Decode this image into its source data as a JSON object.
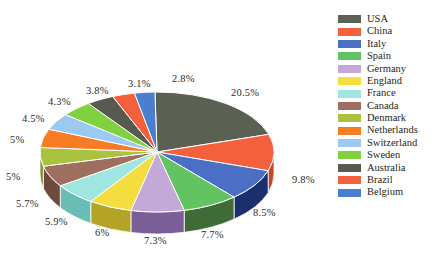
{
  "background": "#ffffff",
  "text_color": "#2b2b2b",
  "legend": {
    "items": [
      {
        "label": "USA",
        "color": "#5b6152",
        "side": "#434839"
      },
      {
        "label": "China",
        "color": "#f4603c",
        "side": "#c94526"
      },
      {
        "label": "Italy",
        "color": "#4a6fc4",
        "side": "#1b2f6e"
      },
      {
        "label": "Spain",
        "color": "#62c362",
        "side": "#3f6b36"
      },
      {
        "label": "Germany",
        "color": "#c3a8d8",
        "side": "#7b5e97"
      },
      {
        "label": "England",
        "color": "#f3dd3f",
        "side": "#b3a327"
      },
      {
        "label": "France",
        "color": "#9fe5e0",
        "side": "#69bdb5"
      },
      {
        "label": "Canada",
        "color": "#9e6f5e",
        "side": "#6d4a3c"
      },
      {
        "label": "Denmark",
        "color": "#a9c23f",
        "side": "#7b8f2c"
      },
      {
        "label": "Netherlands",
        "color": "#f87c24",
        "side": "#c85b12"
      },
      {
        "label": "Switzerland",
        "color": "#9cc9ef",
        "side": "#6fa4d2"
      },
      {
        "label": "Sweden",
        "color": "#7fd13f",
        "side": "#5aa02b"
      },
      {
        "label": "Australia",
        "color": "#58594f",
        "side": "#3d3e36"
      },
      {
        "label": "Brazil",
        "color": "#f4603c",
        "side": "#c94526"
      },
      {
        "label": "Belgium",
        "color": "#4a7fd0",
        "side": "#2a538f"
      }
    ]
  },
  "chart_data": {
    "type": "pie",
    "title": "",
    "legend_position": "right",
    "three_d": true,
    "labels": [
      "USA",
      "China",
      "Italy",
      "Spain",
      "Germany",
      "England",
      "France",
      "Canada",
      "Denmark",
      "Netherlands",
      "Switzerland",
      "Sweden",
      "Australia",
      "Brazil",
      "Belgium"
    ],
    "values": [
      20.5,
      9.8,
      8.5,
      7.7,
      7.3,
      6,
      5.9,
      5.7,
      5,
      5,
      4.5,
      4.3,
      3.8,
      3.1,
      2.8
    ],
    "value_labels": [
      "20.5%",
      "9.8%",
      "8.5%",
      "7.7%",
      "7.3%",
      "6%",
      "5.9%",
      "5.7%",
      "5%",
      "5%",
      "4.5%",
      "4.3%",
      "3.8%",
      "3.1%",
      "2.8%"
    ],
    "unit": "%",
    "colors": [
      "#5b6152",
      "#f4603c",
      "#4a6fc4",
      "#62c362",
      "#c3a8d8",
      "#f3dd3f",
      "#9fe5e0",
      "#9e6f5e",
      "#a9c23f",
      "#f87c24",
      "#9cc9ef",
      "#7fd13f",
      "#58594f",
      "#f4603c",
      "#4a7fd0"
    ]
  },
  "geometry": {
    "cx": 157,
    "cy": 152,
    "rx": 117,
    "ry": 60,
    "depth": 22,
    "start_angle": -91
  },
  "label_positions": [
    {
      "text": "20.5%",
      "x": 231,
      "y": 88
    },
    {
      "text": "9.8%",
      "x": 292,
      "y": 175
    },
    {
      "text": "8.5%",
      "x": 253,
      "y": 208
    },
    {
      "text": "7.7%",
      "x": 201,
      "y": 230
    },
    {
      "text": "7.3%",
      "x": 144,
      "y": 236
    },
    {
      "text": "6%",
      "x": 95,
      "y": 228
    },
    {
      "text": "5.9%",
      "x": 45,
      "y": 217
    },
    {
      "text": "5.7%",
      "x": 16,
      "y": 199
    },
    {
      "text": "5%",
      "x": 6,
      "y": 172
    },
    {
      "text": "5%",
      "x": 10,
      "y": 135
    },
    {
      "text": "4.5%",
      "x": 22,
      "y": 114
    },
    {
      "text": "4.3%",
      "x": 48,
      "y": 97
    },
    {
      "text": "3.8%",
      "x": 86,
      "y": 86
    },
    {
      "text": "3.1%",
      "x": 128,
      "y": 79
    },
    {
      "text": "2.8%",
      "x": 172,
      "y": 74
    }
  ]
}
